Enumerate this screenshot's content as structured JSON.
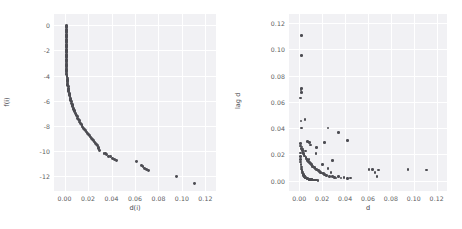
{
  "figure": {
    "background_color": "#ffffff",
    "axes_face_color": "#f1f1f4",
    "grid_color": "#ffffff",
    "marker_color": "#4c4c52",
    "text_color": "#4a4a4f"
  },
  "chart_data": [
    {
      "type": "scatter",
      "panel": "left",
      "title": "",
      "xlabel": "d(i)",
      "ylabel": "f(i)",
      "xlim": [
        -0.009,
        0.129
      ],
      "ylim": [
        -13.2,
        0.9
      ],
      "xticks": [
        0.0,
        0.02,
        0.04,
        0.06,
        0.08,
        0.1,
        0.12
      ],
      "xticklabels": [
        "0.00",
        "0.02",
        "0.04",
        "0.06",
        "0.08",
        "0.10",
        "0.12"
      ],
      "yticks": [
        0,
        -2,
        -4,
        -6,
        -8,
        -10,
        -12
      ],
      "yticklabels": [
        "0",
        "-2",
        "-4",
        "-6",
        "-8",
        "-10",
        "-12"
      ],
      "grid": true,
      "legend": "none",
      "x": [
        0.0013,
        0.0013,
        0.0013,
        0.0013,
        0.0013,
        0.0013,
        0.0013,
        0.0013,
        0.0013,
        0.0013,
        0.0013,
        0.0013,
        0.0013,
        0.0013,
        0.0013,
        0.0014,
        0.0014,
        0.0014,
        0.0014,
        0.0014,
        0.0014,
        0.0014,
        0.0014,
        0.0015,
        0.0015,
        0.0015,
        0.0015,
        0.0015,
        0.0016,
        0.0016,
        0.0016,
        0.0016,
        0.0017,
        0.0017,
        0.0017,
        0.0018,
        0.0018,
        0.0019,
        0.0019,
        0.002,
        0.0021,
        0.0021,
        0.0022,
        0.0023,
        0.0024,
        0.0025,
        0.0026,
        0.0027,
        0.0028,
        0.003,
        0.0031,
        0.0033,
        0.0035,
        0.0037,
        0.0039,
        0.0041,
        0.0043,
        0.0046,
        0.0048,
        0.0051,
        0.0054,
        0.0057,
        0.006,
        0.0064,
        0.0067,
        0.0071,
        0.0075,
        0.0079,
        0.0083,
        0.0088,
        0.0092,
        0.0097,
        0.0102,
        0.0107,
        0.0113,
        0.0118,
        0.0124,
        0.013,
        0.0136,
        0.0143,
        0.0149,
        0.0156,
        0.0163,
        0.017,
        0.0178,
        0.0186,
        0.0194,
        0.0202,
        0.021,
        0.0219,
        0.0228,
        0.0237,
        0.0246,
        0.0256,
        0.0265,
        0.0275,
        0.0282,
        0.0288,
        0.0292,
        0.0296,
        0.0336,
        0.0348,
        0.036,
        0.0378,
        0.039,
        0.0412,
        0.0428,
        0.0442,
        0.061,
        0.0655,
        0.0668,
        0.0682,
        0.07,
        0.0712,
        0.095,
        0.111
      ],
      "y": [
        0.0,
        -0.1,
        -0.2,
        -0.3,
        -0.4,
        -0.5,
        -0.6,
        -0.7,
        -0.8,
        -0.9,
        -1.0,
        -1.1,
        -1.2,
        -1.3,
        -1.4,
        -1.5,
        -1.6,
        -1.7,
        -1.8,
        -1.9,
        -2.0,
        -2.1,
        -2.2,
        -2.3,
        -2.4,
        -2.5,
        -2.6,
        -2.7,
        -2.8,
        -2.9,
        -3.0,
        -3.1,
        -3.2,
        -3.3,
        -3.4,
        -3.5,
        -3.6,
        -3.7,
        -3.8,
        -3.9,
        -4.0,
        -4.1,
        -4.2,
        -4.3,
        -4.4,
        -4.5,
        -4.6,
        -4.7,
        -4.8,
        -4.9,
        -5.0,
        -5.1,
        -5.2,
        -5.3,
        -5.4,
        -5.5,
        -5.6,
        -5.7,
        -5.8,
        -5.9,
        -6.0,
        -6.1,
        -6.2,
        -6.3,
        -6.4,
        -6.5,
        -6.6,
        -6.7,
        -6.8,
        -6.9,
        -7.0,
        -7.1,
        -7.2,
        -7.3,
        -7.4,
        -7.5,
        -7.6,
        -7.7,
        -7.8,
        -7.9,
        -8.0,
        -8.1,
        -8.2,
        -8.3,
        -8.4,
        -8.5,
        -8.6,
        -8.7,
        -8.8,
        -8.9,
        -9.0,
        -9.1,
        -9.2,
        -9.3,
        -9.4,
        -9.5,
        -9.6,
        -9.72,
        -9.84,
        -9.96,
        -10.18,
        -10.22,
        -10.3,
        -10.42,
        -10.48,
        -10.6,
        -10.68,
        -10.74,
        -10.88,
        -11.16,
        -11.28,
        -11.38,
        -11.5,
        -11.58,
        -12.02,
        -12.6
      ]
    },
    {
      "type": "scatter",
      "panel": "right",
      "title": "",
      "xlabel": "d",
      "ylabel": "lag d",
      "xlim": [
        -0.009,
        0.129
      ],
      "ylim": [
        -0.008,
        0.127
      ],
      "xticks": [
        0.0,
        0.02,
        0.04,
        0.06,
        0.08,
        0.1,
        0.12
      ],
      "xticklabels": [
        "0.00",
        "0.02",
        "0.04",
        "0.06",
        "0.08",
        "0.10",
        "0.12"
      ],
      "yticks": [
        0.0,
        0.02,
        0.04,
        0.06,
        0.08,
        0.1,
        0.12
      ],
      "yticklabels": [
        "0.00",
        "0.02",
        "0.04",
        "0.06",
        "0.08",
        "0.10",
        "0.12"
      ],
      "grid": true,
      "legend": "none",
      "x": [
        0.0022,
        0.002,
        0.0014,
        0.0018,
        0.0022,
        0.0013,
        0.0016,
        0.0019,
        0.005,
        0.007,
        0.009,
        0.01,
        0.015,
        0.022,
        0.025,
        0.029,
        0.034,
        0.042,
        0.001,
        0.0012,
        0.0015,
        0.0024,
        0.0026,
        0.003,
        0.0033,
        0.0038,
        0.0042,
        0.0046,
        0.0052,
        0.0058,
        0.0062,
        0.0068,
        0.0074,
        0.008,
        0.0086,
        0.0092,
        0.0098,
        0.0105,
        0.0112,
        0.0118,
        0.0124,
        0.013,
        0.0138,
        0.0145,
        0.0152,
        0.016,
        0.0168,
        0.0176,
        0.0185,
        0.0193,
        0.0202,
        0.021,
        0.022,
        0.023,
        0.024,
        0.0252,
        0.0265,
        0.0278,
        0.0292,
        0.0306,
        0.032,
        0.034,
        0.0365,
        0.039,
        0.042,
        0.045,
        0.061,
        0.064,
        0.066,
        0.068,
        0.069,
        0.095,
        0.111,
        0.0008,
        0.0009,
        0.0011,
        0.0013,
        0.0016,
        0.0018,
        0.0021,
        0.0023,
        0.0026,
        0.0029,
        0.0032,
        0.0035,
        0.0039,
        0.0043,
        0.0047,
        0.0051,
        0.0056,
        0.0061,
        0.0066,
        0.0072,
        0.0078,
        0.0084,
        0.009,
        0.0097,
        0.0104,
        0.0111,
        0.0119,
        0.0127,
        0.0135,
        0.0144,
        0.0153,
        0.0163
      ],
      "y": [
        0.1105,
        0.0955,
        0.069,
        0.07,
        0.067,
        0.063,
        0.0455,
        0.04,
        0.0465,
        0.03,
        0.029,
        0.027,
        0.025,
        0.029,
        0.04,
        0.0155,
        0.0365,
        0.0305,
        0.028,
        0.0262,
        0.0245,
        0.0255,
        0.024,
        0.0228,
        0.0215,
        0.0205,
        0.0198,
        0.0186,
        0.0225,
        0.0178,
        0.0165,
        0.0158,
        0.015,
        0.0142,
        0.016,
        0.0135,
        0.0128,
        0.012,
        0.0115,
        0.0108,
        0.0102,
        0.0098,
        0.0092,
        0.0205,
        0.0086,
        0.008,
        0.0074,
        0.0068,
        0.0062,
        0.0058,
        0.012,
        0.0052,
        0.0048,
        0.0042,
        0.0038,
        0.009,
        0.0032,
        0.006,
        0.0028,
        0.0024,
        0.002,
        0.003,
        0.0018,
        0.0025,
        0.0015,
        0.002,
        0.0085,
        0.0082,
        0.006,
        0.0028,
        0.008,
        0.0085,
        0.008,
        0.021,
        0.0185,
        0.016,
        0.014,
        0.012,
        0.0102,
        0.0088,
        0.0076,
        0.0066,
        0.0058,
        0.005,
        0.0044,
        0.0038,
        0.0033,
        0.0029,
        0.0025,
        0.0022,
        0.0019,
        0.0016,
        0.0014,
        0.0012,
        0.001,
        0.0009,
        0.0008,
        0.0007,
        0.0006,
        0.0005,
        0.0004,
        0.0004,
        0.0003,
        0.0003,
        0.0002
      ]
    }
  ]
}
